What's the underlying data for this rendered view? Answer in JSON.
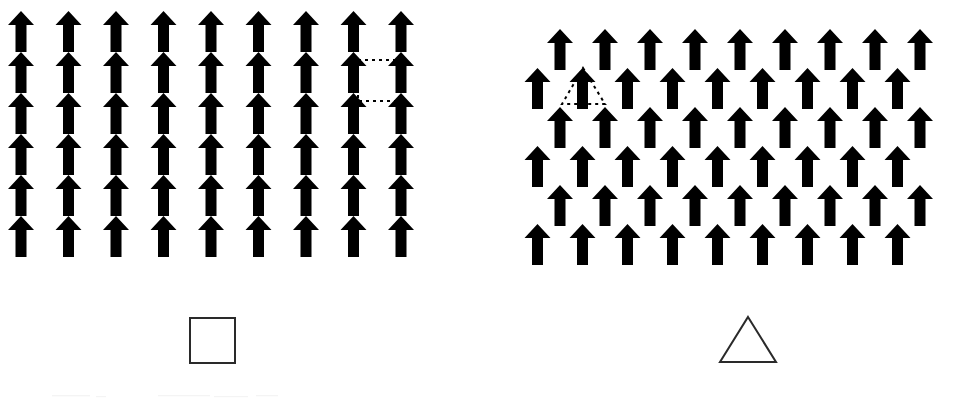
{
  "figure": {
    "background_color": "#ffffff",
    "ink_color": "#000000",
    "stroke_color": "#1a1a1a",
    "width": 973,
    "height": 401
  },
  "arrow_glyph": {
    "name": "up-arrow-glyph",
    "fill": "#000000",
    "width": 26,
    "height": 41,
    "shaft_width": 11,
    "head_width": 26,
    "head_height": 14
  },
  "panels": [
    {
      "id": "square-lattice",
      "name": "Square lattice panel",
      "lattice_type": "square",
      "columns": 9,
      "rows": 6,
      "col_spacing": 47.5,
      "row_spacing": 41,
      "row_offset": 0,
      "origin_x": 21,
      "origin_y": 11,
      "arrow_count": 54,
      "unit_cell": {
        "name": "square-unit-cell",
        "shape": "square",
        "style": "dotted",
        "stroke": "#000000",
        "stroke_width": 2,
        "dash": "3 4",
        "vertices_cols": [
          8,
          9
        ],
        "vertices_rows": [
          1,
          2
        ],
        "x": 358,
        "y": 60,
        "size": 41
      },
      "legend": {
        "name": "square-legend",
        "shape": "square",
        "fill": "none",
        "stroke": "#2a2a2a",
        "stroke_width": 2,
        "x": 190,
        "y": 318,
        "size": 45
      }
    },
    {
      "id": "triangular-lattice",
      "name": "Triangular (hexagonal) lattice panel",
      "lattice_type": "triangular",
      "columns": 9,
      "rows": 6,
      "col_spacing": 45,
      "row_spacing": 39,
      "row_offset": 22.5,
      "origin_x": 560,
      "origin_y": 29,
      "arrow_count": 54,
      "unit_cell": {
        "name": "triangle-unit-cell",
        "shape": "triangle",
        "style": "dotted",
        "stroke": "#000000",
        "stroke_width": 2,
        "dash": "3 4",
        "apex_row": 1,
        "base_row": 2,
        "apex_x": 583,
        "apex_y": 68,
        "base_left_x": 562,
        "base_right_x": 605,
        "base_y": 104
      },
      "legend": {
        "name": "triangle-legend",
        "shape": "triangle",
        "fill": "none",
        "stroke": "#2a2a2a",
        "stroke_width": 2,
        "apex_x": 748,
        "apex_y": 317,
        "left_x": 720,
        "right_x": 776,
        "base_y": 362
      }
    }
  ],
  "legend_items": [
    {
      "name": "square-symbol",
      "label": "",
      "shape": "square"
    },
    {
      "name": "triangle-symbol",
      "label": "",
      "shape": "triangle"
    }
  ]
}
